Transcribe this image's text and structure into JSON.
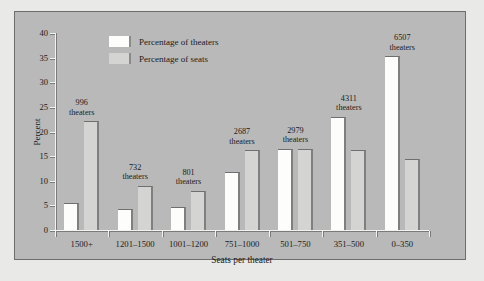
{
  "chart_data": {
    "type": "bar",
    "title": "",
    "xlabel": "Seats per theater",
    "ylabel": "Percent",
    "ylim": [
      0,
      40
    ],
    "yticks": [
      0,
      5,
      10,
      15,
      20,
      25,
      30,
      35,
      40
    ],
    "grid": false,
    "legend_position": "upper center",
    "categories": [
      "1500+",
      "1201–1500",
      "1001–1200",
      "751–1000",
      "501–750",
      "351–500",
      "0–350"
    ],
    "series": [
      {
        "name": "Percentage of theaters",
        "color": "#fdfdfb",
        "values": [
          5.5,
          4.3,
          4.7,
          11.7,
          16.5,
          23.0,
          35.3
        ]
      },
      {
        "name": "Percentage of seats",
        "color": "#d4d4d2",
        "values": [
          22.1,
          9.0,
          8.0,
          16.2,
          16.5,
          16.3,
          14.5
        ]
      }
    ],
    "annotations": [
      {
        "category": "1500+",
        "count": "996",
        "unit": "theaters"
      },
      {
        "category": "1201–1500",
        "count": "732",
        "unit": "theaters"
      },
      {
        "category": "1001–1200",
        "count": "801",
        "unit": "theaters"
      },
      {
        "category": "751–1000",
        "count": "2687",
        "unit": "theaters"
      },
      {
        "category": "501–750",
        "count": "2979",
        "unit": "theaters"
      },
      {
        "category": "351–500",
        "count": "4311",
        "unit": "theaters"
      },
      {
        "category": "0–350",
        "count": "6507",
        "unit": "theaters"
      }
    ]
  },
  "legend": {
    "items": [
      {
        "label": "Percentage of theaters"
      },
      {
        "label": "Percentage of seats"
      }
    ]
  },
  "colors": {
    "figure_background": "#b9b9b9",
    "page_background": "#e9e9e7",
    "frame": "#6d6d6d",
    "axis": "#7a7a7a",
    "text": "#1b1b1b"
  }
}
